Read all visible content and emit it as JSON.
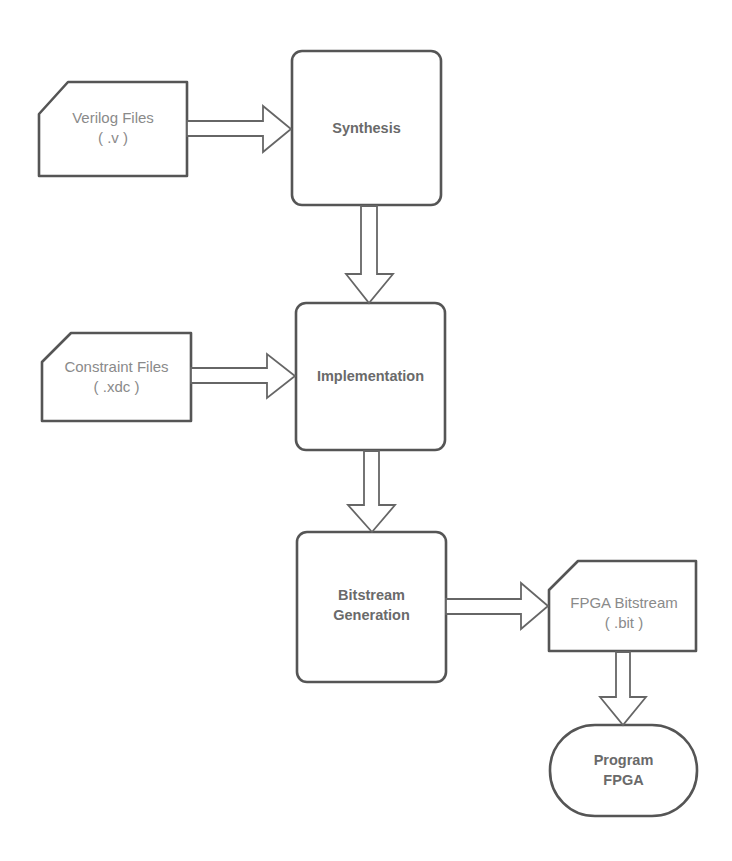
{
  "diagram": {
    "colors": {
      "stroke": "#555555",
      "file_text": "#8a8a8a",
      "process_text": "#6a6a6a",
      "background": "#ffffff"
    },
    "inputs": {
      "verilog": {
        "line1": "Verilog Files",
        "line2": "( .v )"
      },
      "constraint": {
        "line1": "Constraint Files",
        "line2": "( .xdc )"
      }
    },
    "processes": {
      "synthesis": {
        "label": "Synthesis"
      },
      "implementation": {
        "label": "Implementation"
      },
      "bitstream": {
        "line1": "Bitstream",
        "line2": "Generation"
      }
    },
    "outputs": {
      "fpga_bitstream": {
        "line1": "FPGA Bitstream",
        "line2": "( .bit )"
      }
    },
    "terminal": {
      "program_fpga": {
        "line1": "Program",
        "line2": "FPGA"
      }
    },
    "edges": [
      {
        "from": "Verilog Files",
        "to": "Synthesis"
      },
      {
        "from": "Synthesis",
        "to": "Implementation"
      },
      {
        "from": "Constraint Files",
        "to": "Implementation"
      },
      {
        "from": "Implementation",
        "to": "Bitstream Generation"
      },
      {
        "from": "Bitstream Generation",
        "to": "FPGA Bitstream"
      },
      {
        "from": "FPGA Bitstream",
        "to": "Program FPGA"
      }
    ]
  }
}
